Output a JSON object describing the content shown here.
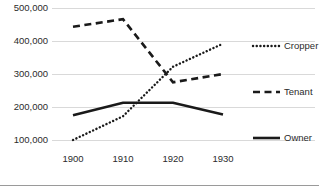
{
  "chart_data": {
    "type": "line",
    "title": "",
    "subtitle": "",
    "xlabel": "",
    "ylabel": "",
    "x": [
      1900,
      1910,
      1920,
      1930
    ],
    "xlim": [
      1897,
      1933
    ],
    "ylim": [
      100000,
      500000
    ],
    "grid": true,
    "legend_position": "right",
    "x_tick_labels": [
      "1900",
      "1910",
      "1920",
      "1930"
    ],
    "y_tick_labels": [
      "100,000",
      "200,000",
      "300,000",
      "400,000",
      "500,000"
    ],
    "y_ticks": [
      100000,
      200000,
      300000,
      400000,
      500000
    ],
    "series": [
      {
        "name": "Cropper",
        "style": "dotted",
        "color": "#1a1a1a",
        "values": [
          100000,
          172000,
          322000,
          392000
        ]
      },
      {
        "name": "Tenant",
        "style": "dashed",
        "color": "#1a1a1a",
        "values": [
          443000,
          466000,
          275000,
          300000
        ]
      },
      {
        "name": "Owner",
        "style": "solid",
        "color": "#1a1a1a",
        "values": [
          175000,
          213000,
          213000,
          177000
        ]
      }
    ]
  },
  "legend": {
    "items": [
      {
        "label": "Cropper"
      },
      {
        "label": "Tenant"
      },
      {
        "label": "Owner"
      }
    ]
  },
  "colors": {
    "ink": "#1a1a1a",
    "grid": "#d9d9d9",
    "text": "#2b2b2b",
    "background": "#ffffff"
  }
}
